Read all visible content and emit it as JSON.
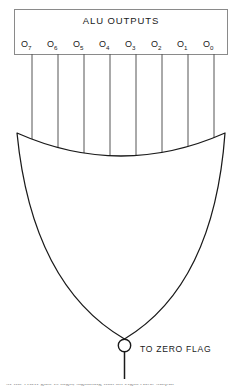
{
  "figure": {
    "type": "logic-diagram",
    "background_color": "#ffffff",
    "line_color": "#1a1a1a",
    "box_border_color": "#8a8a8a"
  },
  "bus": {
    "title": "ALU OUTPUTS",
    "bits": [
      {
        "name": "O",
        "subscript": "7"
      },
      {
        "name": "O",
        "subscript": "6"
      },
      {
        "name": "O",
        "subscript": "5"
      },
      {
        "name": "O",
        "subscript": "4"
      },
      {
        "name": "O",
        "subscript": "3"
      },
      {
        "name": "O",
        "subscript": "2"
      },
      {
        "name": "O",
        "subscript": "1"
      },
      {
        "name": "O",
        "subscript": "0"
      }
    ]
  },
  "gate": {
    "kind": "NOR",
    "input_count": 8,
    "inverting_bubble": true
  },
  "output": {
    "label": "TO ZERO FLAG"
  },
  "caption": {
    "text": "of the NOR gate is high, signaling that all eight ALU output"
  }
}
